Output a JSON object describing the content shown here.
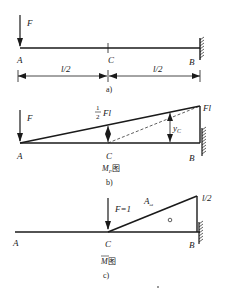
{
  "figure": {
    "panel_a": {
      "caption": "a)",
      "force_label": "F",
      "points": {
        "A": "A",
        "C": "C",
        "B": "B"
      },
      "dimensions": [
        "l/2",
        "l/2"
      ]
    },
    "panel_b": {
      "caption": "b)",
      "diagram_title": "M",
      "diagram_title_sub": "P",
      "diagram_title_suffix": "图",
      "force_label": "F",
      "points": {
        "A": "A",
        "C": "C",
        "B": "B"
      },
      "mid_value_frac_num": "1",
      "mid_value_frac_den": "2",
      "mid_value_suffix": "Fl",
      "end_value": "Fl",
      "ordinate_label": "y",
      "ordinate_sub": "C"
    },
    "panel_c": {
      "caption": "c)",
      "diagram_title": "M",
      "diagram_title_suffix": "图",
      "force_label": "F=1",
      "area_label": "A",
      "area_sub": "ω",
      "end_value": "l/2",
      "points": {
        "A": "A",
        "C": "C",
        "B": "B"
      }
    },
    "colors": {
      "ink": "#1a1a1a",
      "background": "#ffffff"
    }
  }
}
